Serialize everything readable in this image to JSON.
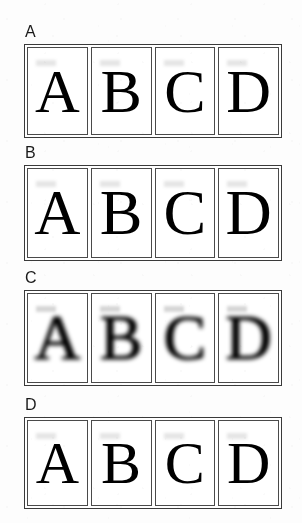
{
  "figure": {
    "background_color": "#fdfdfd",
    "ink_color": "#000000",
    "frame_color": "#3a3a3a",
    "cell_border_color": "#4a4a4a",
    "panels": [
      {
        "label": "A",
        "degradation": "low",
        "cells": [
          {
            "glyph": "A"
          },
          {
            "glyph": "B"
          },
          {
            "glyph": "C"
          },
          {
            "glyph": "D"
          }
        ]
      },
      {
        "label": "B",
        "degradation": "medium",
        "cells": [
          {
            "glyph": "A"
          },
          {
            "glyph": "B"
          },
          {
            "glyph": "C"
          },
          {
            "glyph": "D"
          }
        ]
      },
      {
        "label": "C",
        "degradation": "high",
        "cells": [
          {
            "glyph": "A"
          },
          {
            "glyph": "B"
          },
          {
            "glyph": "C"
          },
          {
            "glyph": "D"
          }
        ]
      },
      {
        "label": "D",
        "degradation": "low",
        "cells": [
          {
            "glyph": "A"
          },
          {
            "glyph": "B"
          },
          {
            "glyph": "C"
          },
          {
            "glyph": "D"
          }
        ]
      }
    ]
  }
}
